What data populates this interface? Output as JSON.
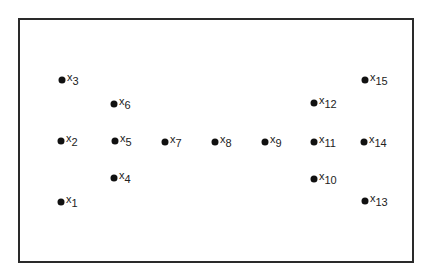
{
  "diagram": {
    "frame_color": "#2a2a2a",
    "dot_color": "#111111",
    "points": [
      {
        "var": "x",
        "index": "1",
        "cx": 61,
        "cy": 202
      },
      {
        "var": "x",
        "index": "2",
        "cx": 61,
        "cy": 141
      },
      {
        "var": "x",
        "index": "3",
        "cx": 62,
        "cy": 80
      },
      {
        "var": "x",
        "index": "4",
        "cx": 114,
        "cy": 178
      },
      {
        "var": "x",
        "index": "5",
        "cx": 115,
        "cy": 141
      },
      {
        "var": "x",
        "index": "6",
        "cx": 114,
        "cy": 104
      },
      {
        "var": "x",
        "index": "7",
        "cx": 165,
        "cy": 142
      },
      {
        "var": "x",
        "index": "8",
        "cx": 215,
        "cy": 142
      },
      {
        "var": "x",
        "index": "9",
        "cx": 265,
        "cy": 142
      },
      {
        "var": "x",
        "index": "10",
        "cx": 314,
        "cy": 179
      },
      {
        "var": "x",
        "index": "11",
        "cx": 314,
        "cy": 142
      },
      {
        "var": "x",
        "index": "12",
        "cx": 314,
        "cy": 103
      },
      {
        "var": "x",
        "index": "13",
        "cx": 365,
        "cy": 201
      },
      {
        "var": "x",
        "index": "14",
        "cx": 364,
        "cy": 142
      },
      {
        "var": "x",
        "index": "15",
        "cx": 365,
        "cy": 80
      }
    ]
  }
}
